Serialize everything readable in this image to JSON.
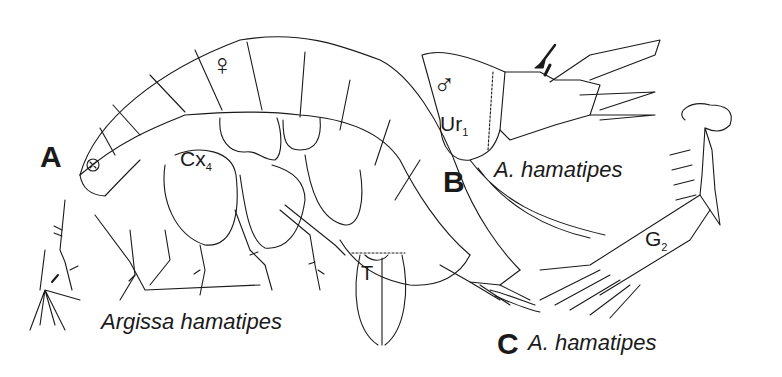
{
  "figure": {
    "panels": [
      {
        "id": "A",
        "letter": "A",
        "species_label": "Argissa hamatipes",
        "sex_symbol": "♀",
        "annotations": {
          "coxa_label": "Cx",
          "coxa_sub": "4",
          "telson_label": "T"
        }
      },
      {
        "id": "B",
        "letter": "B",
        "species_label": "A. hamatipes",
        "sex_symbol": "♂",
        "annotations": {
          "uropod_label": "Ur",
          "uropod_sub": "1"
        }
      },
      {
        "id": "C",
        "letter": "C",
        "species_label": "A. hamatipes",
        "annotations": {
          "gnathopod_label": "G",
          "gnathopod_sub": "2"
        }
      }
    ],
    "line_color": "#1a1a1a",
    "background": "#ffffff"
  }
}
